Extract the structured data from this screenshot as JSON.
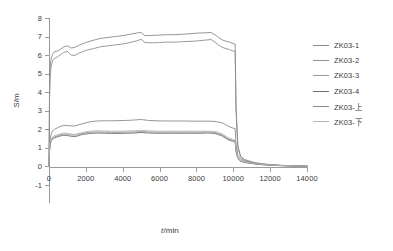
{
  "chart_data": {
    "type": "line",
    "title": "",
    "xlabel": "t/min",
    "ylabel": "S/m",
    "xlim": [
      0,
      14000
    ],
    "ylim": [
      -1,
      8
    ],
    "xticks": [
      0,
      2000,
      4000,
      6000,
      8000,
      10000,
      12000,
      14000
    ],
    "yticks": [
      -1,
      0,
      1,
      2,
      3,
      4,
      5,
      6,
      7,
      8
    ],
    "grid": false,
    "legend_position": "right",
    "series": [
      {
        "name": "ZK03-1",
        "color": "#8a8a8a",
        "x": [
          0,
          30,
          60,
          120,
          200,
          300,
          450,
          600,
          800,
          1000,
          1200,
          1400,
          1600,
          2000,
          2400,
          2800,
          3200,
          3600,
          4000,
          4400,
          4800,
          5000,
          5200,
          5600,
          6000,
          6400,
          6800,
          7200,
          7600,
          8000,
          8400,
          8800,
          9000,
          9200,
          9400,
          9600,
          9800,
          10000,
          10100,
          10150,
          10250,
          10400,
          10600,
          10900,
          11200,
          11600,
          12000,
          12600,
          13200,
          14000
        ],
        "values": [
          0.1,
          4.2,
          5.3,
          5.85,
          6.05,
          6.18,
          6.22,
          6.3,
          6.45,
          6.5,
          6.38,
          6.42,
          6.52,
          6.68,
          6.8,
          6.9,
          6.95,
          7.0,
          7.05,
          7.12,
          7.2,
          7.22,
          7.05,
          7.06,
          7.08,
          7.1,
          7.1,
          7.12,
          7.15,
          7.18,
          7.2,
          7.22,
          7.1,
          6.95,
          6.82,
          6.75,
          6.7,
          6.62,
          6.6,
          3.2,
          1.1,
          0.55,
          0.38,
          0.28,
          0.2,
          0.14,
          0.1,
          0.06,
          0.04,
          0.02
        ]
      },
      {
        "name": "ZK03-2",
        "color": "#8f8f8f",
        "x": [
          0,
          30,
          60,
          120,
          200,
          300,
          450,
          600,
          800,
          1000,
          1200,
          1400,
          1600,
          2000,
          2400,
          2800,
          3200,
          3600,
          4000,
          4400,
          4800,
          5000,
          5200,
          5600,
          6000,
          6400,
          6800,
          7200,
          7600,
          8000,
          8400,
          8800,
          9000,
          9200,
          9400,
          9600,
          9800,
          10000,
          10100,
          10150,
          10250,
          10400,
          10600,
          10900,
          11200,
          11600,
          12000,
          12600,
          13200,
          14000
        ],
        "values": [
          0.05,
          3.6,
          4.8,
          5.45,
          5.7,
          5.82,
          5.9,
          6.0,
          6.15,
          6.2,
          6.0,
          5.98,
          6.1,
          6.25,
          6.35,
          6.45,
          6.5,
          6.55,
          6.6,
          6.68,
          6.78,
          6.85,
          6.68,
          6.66,
          6.68,
          6.7,
          6.7,
          6.72,
          6.74,
          6.76,
          6.8,
          6.84,
          6.7,
          6.55,
          6.42,
          6.35,
          6.3,
          6.22,
          6.2,
          3.0,
          1.0,
          0.5,
          0.35,
          0.26,
          0.18,
          0.13,
          0.09,
          0.055,
          0.035,
          0.02
        ]
      },
      {
        "name": "ZK03-3",
        "color": "#9b9b9b",
        "x": [
          0,
          30,
          60,
          120,
          200,
          300,
          450,
          600,
          800,
          1000,
          1400,
          1800,
          2200,
          2600,
          3000,
          3400,
          3800,
          4200,
          4600,
          5000,
          5400,
          5800,
          6200,
          6600,
          7000,
          7400,
          7800,
          8200,
          8600,
          9000,
          9400,
          9700,
          10000,
          10100,
          10150,
          10250,
          10400,
          10600,
          10900,
          11200,
          11600,
          12000,
          12600,
          13200,
          14000
        ],
        "values": [
          0.08,
          0.9,
          1.25,
          1.45,
          1.55,
          1.6,
          1.65,
          1.7,
          1.75,
          1.72,
          1.68,
          1.78,
          1.84,
          1.86,
          1.85,
          1.84,
          1.84,
          1.85,
          1.86,
          1.88,
          1.86,
          1.85,
          1.85,
          1.85,
          1.85,
          1.85,
          1.85,
          1.85,
          1.86,
          1.84,
          1.7,
          1.5,
          1.4,
          1.38,
          0.85,
          0.45,
          0.3,
          0.24,
          0.18,
          0.14,
          0.1,
          0.07,
          0.045,
          0.03,
          0.015
        ]
      },
      {
        "name": "ZK03-4",
        "color": "#6e6e6e",
        "x": [
          0,
          30,
          60,
          120,
          200,
          300,
          450,
          600,
          800,
          1000,
          1400,
          1800,
          2200,
          2600,
          3000,
          3400,
          3800,
          4200,
          4600,
          5000,
          5400,
          5800,
          6200,
          6600,
          7000,
          7400,
          7800,
          8200,
          8600,
          9000,
          9400,
          9700,
          10000,
          10100,
          10150,
          10250,
          10400,
          10600,
          10900,
          11200,
          11600,
          12000,
          12600,
          13200,
          14000
        ],
        "values": [
          0.06,
          0.8,
          1.15,
          1.38,
          1.48,
          1.54,
          1.6,
          1.64,
          1.68,
          1.66,
          1.6,
          1.72,
          1.78,
          1.8,
          1.79,
          1.78,
          1.78,
          1.79,
          1.8,
          1.83,
          1.8,
          1.79,
          1.79,
          1.79,
          1.79,
          1.79,
          1.79,
          1.79,
          1.8,
          1.78,
          1.64,
          1.45,
          1.35,
          1.33,
          0.8,
          0.42,
          0.28,
          0.22,
          0.17,
          0.13,
          0.09,
          0.065,
          0.04,
          0.026,
          0.013
        ]
      },
      {
        "name": "ZK03-上",
        "color": "#8a8a8a",
        "x": [
          0,
          30,
          60,
          120,
          200,
          300,
          450,
          600,
          800,
          1000,
          1400,
          1800,
          2200,
          2600,
          3000,
          3400,
          3800,
          4200,
          4600,
          5000,
          5400,
          5800,
          6200,
          6600,
          7000,
          7400,
          7800,
          8200,
          8600,
          9000,
          9400,
          9700,
          10000,
          10100,
          10150,
          10250,
          10400,
          10600,
          10900,
          11200,
          11600,
          12000,
          12600,
          13200,
          14000
        ],
        "values": [
          0.12,
          1.05,
          1.45,
          1.75,
          1.92,
          2.0,
          2.08,
          2.15,
          2.22,
          2.2,
          2.18,
          2.3,
          2.4,
          2.45,
          2.46,
          2.46,
          2.47,
          2.48,
          2.5,
          2.53,
          2.48,
          2.46,
          2.45,
          2.45,
          2.45,
          2.45,
          2.44,
          2.44,
          2.44,
          2.43,
          2.35,
          2.18,
          2.06,
          2.04,
          1.2,
          0.6,
          0.4,
          0.3,
          0.22,
          0.17,
          0.12,
          0.085,
          0.05,
          0.035,
          0.02
        ]
      },
      {
        "name": "ZK03-下",
        "color": "#b4b4b4",
        "x": [
          0,
          30,
          60,
          120,
          200,
          300,
          450,
          600,
          800,
          1000,
          1400,
          1800,
          2200,
          2600,
          3000,
          3400,
          3800,
          4200,
          4600,
          5000,
          5400,
          5800,
          6200,
          6600,
          7000,
          7400,
          7800,
          8200,
          8600,
          9000,
          9400,
          9700,
          10000,
          10100,
          10150,
          10250,
          10400,
          10600,
          10900,
          11200,
          11600,
          12000,
          12600,
          13200,
          14000
        ],
        "values": [
          0.1,
          0.95,
          1.3,
          1.5,
          1.6,
          1.66,
          1.7,
          1.74,
          1.8,
          1.78,
          1.72,
          1.82,
          1.9,
          1.92,
          1.91,
          1.9,
          1.9,
          1.91,
          1.92,
          1.95,
          1.92,
          1.9,
          1.9,
          1.9,
          1.9,
          1.9,
          1.9,
          1.9,
          1.9,
          1.89,
          1.76,
          1.56,
          1.45,
          1.43,
          0.88,
          0.47,
          0.32,
          0.25,
          0.19,
          0.15,
          0.105,
          0.075,
          0.048,
          0.032,
          0.016
        ]
      }
    ]
  },
  "axes": {
    "y_title": "S/m",
    "y_title_var": "S",
    "y_title_rest": "/m",
    "x_title": "t/min",
    "x_title_var": "t",
    "x_title_rest": "/min"
  }
}
